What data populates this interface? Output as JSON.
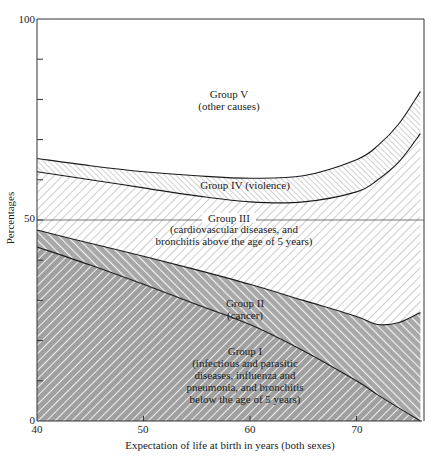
{
  "chart_data": {
    "type": "area",
    "stacked": true,
    "title": "",
    "xlabel": "Expectation of life at birth in years  (both sexes)",
    "ylabel": "Percentages",
    "xlim": [
      40,
      76
    ],
    "ylim": [
      0,
      100
    ],
    "x_ticks": [
      40,
      50,
      60,
      70
    ],
    "y_ticks": [
      0,
      50,
      100
    ],
    "y_minor_ticks": [
      10,
      20,
      30,
      40,
      60,
      70,
      80,
      90
    ],
    "reference_line": 50,
    "x": [
      40,
      45,
      50,
      55,
      60,
      65,
      70,
      72,
      74,
      76
    ],
    "boundaries": {
      "group_I_top": [
        43.3,
        38.8,
        34.0,
        29.0,
        24.0,
        17.5,
        10.0,
        6.5,
        3.2,
        0.0
      ],
      "group_II_top": [
        47.5,
        44.2,
        41.0,
        37.6,
        34.0,
        30.0,
        26.0,
        24.0,
        24.5,
        27.0
      ],
      "group_III_top": [
        62.0,
        60.0,
        58.0,
        56.0,
        54.5,
        54.5,
        57.0,
        60.0,
        64.5,
        71.5
      ],
      "group_IV_top": [
        65.3,
        63.5,
        62.0,
        61.0,
        60.4,
        61.0,
        65.0,
        68.5,
        74.0,
        82.0
      ]
    },
    "series": [
      {
        "name": "Group I",
        "label_lines": [
          "Group I",
          "(infectious and parasitic",
          "diseases, influenza and",
          "pneumonia, and bronchitis",
          "below the age of 5 years)"
        ],
        "values": [
          43.3,
          38.8,
          34.0,
          29.0,
          24.0,
          17.5,
          10.0,
          6.5,
          3.2,
          0.0
        ]
      },
      {
        "name": "Group II",
        "label_lines": [
          "Group II",
          "(cancer)"
        ],
        "values": [
          4.2,
          5.4,
          7.0,
          8.6,
          10.0,
          12.5,
          16.0,
          17.5,
          21.3,
          27.0
        ]
      },
      {
        "name": "Group III",
        "label_lines": [
          "Group III",
          "(cardiovascular diseases, and",
          "bronchitis above the age of 5 years)"
        ],
        "values": [
          14.5,
          15.8,
          17.0,
          18.4,
          20.5,
          24.5,
          31.0,
          36.0,
          40.0,
          44.5
        ]
      },
      {
        "name": "Group IV",
        "label_lines": [
          "Group IV  (violence)"
        ],
        "values": [
          3.3,
          3.5,
          4.0,
          5.0,
          5.9,
          6.5,
          8.0,
          8.5,
          9.5,
          10.5
        ]
      },
      {
        "name": "Group V",
        "label_lines": [
          "Group V",
          "(other causes)"
        ],
        "values": [
          34.7,
          36.5,
          38.0,
          39.0,
          39.6,
          39.0,
          35.0,
          31.5,
          26.0,
          18.0
        ]
      }
    ],
    "colors": {
      "group_I_fill": "#9a9a9a",
      "group_II_fill": "#b0b0b0",
      "group_III_fill": "#ffffff",
      "group_IV_fill": "#ffffff",
      "group_V_fill": "#ffffff",
      "hatch_dark": "#ffffff",
      "hatch_light": "#8c8c8c",
      "line": "#222222"
    },
    "legend": "inline labels inside each region",
    "grid": false
  },
  "axes": {
    "y_tick_labels": [
      "0",
      "50",
      "100"
    ],
    "x_tick_labels": [
      "40",
      "50",
      "60",
      "70"
    ]
  }
}
